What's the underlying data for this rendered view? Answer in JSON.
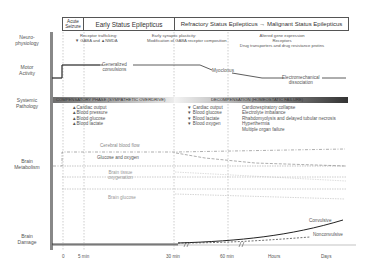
{
  "row_labels": {
    "neurophysiology": "Neuro-\nphysiology",
    "motor_activity": "Motor\nActivity",
    "systemic_pathology": "Systemic\nPathology",
    "brain_metabolism": "Brain\nMetabolism",
    "brain_damage": "Brain\nDamage"
  },
  "stages": {
    "acute": "Acute\nSeizure",
    "early": "Early Status Epilepticus",
    "refractory": "Refractory Status Epilepticus → Malignant Status Epilepticus"
  },
  "neurophysiology": {
    "early_title": "Receptor trafficking:",
    "early_detail": "▼ GABA and ▲NMDA",
    "plasticity_title": "Early synaptic plasticity:",
    "plasticity_detail": "Modification of GABA receptor composition",
    "late_line1": "Altered gene expression",
    "late_line2": "Receptors",
    "late_line3": "Drug transporters and drug resistance protins"
  },
  "motor": {
    "generalized": "Generalized\nconvulsions",
    "myoclonus": "Myoclonus",
    "emd": "Electromechanical\ndissociation"
  },
  "systemic": {
    "compensatory_label": "COMPENSATORY PHASE (SYMPATHETIC OVERDRIVE)",
    "decompensation_label": "DECOMPENSATION (HOMEOSTATIC FAILURE)",
    "compensatory_items": [
      "▲Cardiac output",
      "▲Blood pressure",
      "▲Blood glucose",
      "▲Blood lactate"
    ],
    "decomp_items": [
      "▼ Cardiac output",
      "▼ Blood glucose",
      "▼ Blood lactate",
      "▼ Blood oxygen"
    ],
    "failure_items": [
      "Cardiorespiratory collapse",
      "Electrolyte imbalance",
      "Rhabdomyolysis and delayed tubular necrosis",
      "Hyperthermia",
      "Multiple organ failure"
    ]
  },
  "metabolism": {
    "cbf": "Cerebral blood flow",
    "glucose_oxygen": "Glucose and oxygen",
    "tissue_oxygenation": "Brain tissue\noxygenation",
    "brain_glucose": "Brain glucose"
  },
  "damage": {
    "convulsive": "Convulsive",
    "nonconvulsive": "Nonconvulsive"
  },
  "time_axis": [
    "0",
    "5 min",
    "30 min",
    "60 min",
    "Hours",
    "Days"
  ],
  "colors": {
    "compensatory_bar_start": "#6e6e6e",
    "compensatory_bar_end": "#e6e6e6",
    "decomp_bar_start": "#f2f2f2",
    "decomp_bar_end": "#3a3a3a"
  }
}
